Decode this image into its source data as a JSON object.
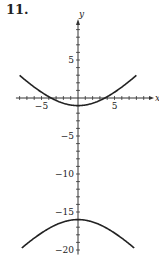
{
  "problem_number": "11.",
  "chart_data": {
    "type": "line",
    "title": "",
    "xlabel": "x",
    "ylabel": "y",
    "xlim": [
      -8.5,
      10
    ],
    "ylim": [
      -21,
      12
    ],
    "x_ticks_labeled": [
      -5,
      5
    ],
    "y_ticks_labeled": [
      5,
      -5,
      -10,
      -15,
      -20
    ],
    "tick_labels": {
      "x": [
        "-5",
        "5"
      ],
      "y": [
        "5",
        "-5",
        "-10",
        "-15",
        "-20"
      ]
    },
    "grid": false,
    "legend": null,
    "series": [
      {
        "name": "upper branch",
        "x": [
          -8,
          -6,
          -4,
          -2,
          0,
          2,
          4,
          6,
          8
        ],
        "y": [
          3.0,
          1.1,
          -0.3,
          -1.0,
          -1.0,
          -1.0,
          -0.3,
          1.1,
          3.0
        ]
      },
      {
        "name": "lower branch",
        "x": [
          -7.5,
          -6,
          -4,
          -2,
          0,
          2,
          4,
          6,
          7.5
        ],
        "y": [
          -19.6,
          -18.6,
          -17.3,
          -16.3,
          -16.0,
          -16.3,
          -17.3,
          -18.6,
          -19.6
        ]
      }
    ],
    "curve_model": {
      "center_y": -8.5,
      "a": 7.5,
      "b": 6.9,
      "form": "(y+8.5)^2/a^2 - x^2/b^2 = 1"
    }
  }
}
